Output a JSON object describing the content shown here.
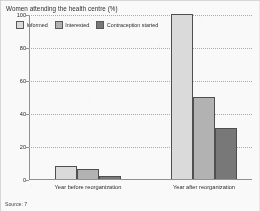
{
  "figure": {
    "title": "Women attending the health centre (%)",
    "source": "Source: 7"
  },
  "colors": {
    "series_informed": "#dedcd8",
    "series_interested": "#b4b2ae",
    "series_contraception": "#77756f",
    "axis": "#8f8f8f",
    "gridline": "#a9a9a9",
    "text": "#1f1f1f",
    "page_background": "#fdfdfc"
  },
  "chart_data": {
    "type": "bar",
    "title": "Women attending the health centre (%)",
    "xlabel": "",
    "ylabel": "",
    "ylim": [
      0,
      100
    ],
    "yticks": [
      0,
      20,
      40,
      60,
      80,
      100
    ],
    "ytick_labels": [
      "0",
      "20",
      "40",
      "60",
      "80",
      "100"
    ],
    "grid": true,
    "grid_style": "dotted-horizontal",
    "legend_position": "top-left",
    "categories": [
      "Year before reorganization",
      "Year after reorganization"
    ],
    "series": [
      {
        "name": "Informed",
        "values": [
          8,
          100
        ]
      },
      {
        "name": "Interested",
        "values": [
          6,
          50
        ]
      },
      {
        "name": "Contraception started",
        "values": [
          2,
          31
        ]
      }
    ]
  }
}
